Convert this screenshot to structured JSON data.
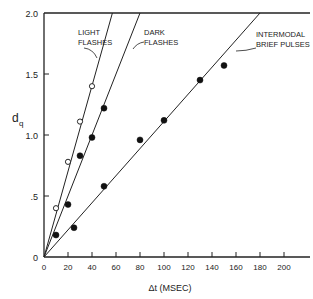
{
  "chart_data": {
    "type": "scatter",
    "title": "",
    "xlabel": "Δt (MSEC)",
    "ylabel": "d_q",
    "ylabel_main": "d",
    "ylabel_sub": "q",
    "xlim": [
      0,
      220
    ],
    "ylim": [
      0,
      2.0
    ],
    "grid": false,
    "legend": "none (inline annotations)",
    "x_ticks": [
      0,
      20,
      40,
      60,
      80,
      100,
      120,
      140,
      160,
      180,
      200
    ],
    "x_tick_labels": [
      "0",
      "20",
      "40",
      "60",
      "80",
      "100",
      "120",
      "140",
      "160",
      "180",
      "200"
    ],
    "y_ticks": [
      0,
      0.5,
      1.0,
      1.5,
      2.0
    ],
    "y_tick_labels": [
      "0",
      ".5",
      "1.0",
      "1.5",
      "2.0"
    ],
    "series": [
      {
        "name": "LIGHT FLASHES",
        "marker": "open-circle",
        "points": [
          [
            10,
            0.4
          ],
          [
            20,
            0.78
          ],
          [
            30,
            1.11
          ],
          [
            40,
            1.4
          ]
        ],
        "fit_line": {
          "from": [
            0,
            0
          ],
          "to": [
            57,
            2.0
          ]
        }
      },
      {
        "name": "DARK FLASHES",
        "marker": "filled-circle",
        "points": [
          [
            10,
            0.18
          ],
          [
            20,
            0.43
          ],
          [
            30,
            0.83
          ],
          [
            40,
            0.98
          ],
          [
            50,
            1.22
          ]
        ],
        "fit_line": {
          "from": [
            0,
            0
          ],
          "to": [
            80,
            2.0
          ]
        }
      },
      {
        "name": "INTERMODAL BRIEF PULSES",
        "marker": "filled-circle",
        "points": [
          [
            25,
            0.24
          ],
          [
            50,
            0.58
          ],
          [
            80,
            0.96
          ],
          [
            100,
            1.12
          ],
          [
            130,
            1.45
          ],
          [
            150,
            1.57
          ]
        ],
        "fit_line": {
          "from": [
            0,
            0
          ],
          "to": [
            180,
            2.0
          ]
        }
      }
    ],
    "annotations": [
      {
        "lines": [
          "LIGHT",
          "FLASHES"
        ],
        "points_to": "LIGHT FLASHES"
      },
      {
        "lines": [
          "DARK",
          "FLASHES"
        ],
        "points_to": "DARK FLASHES"
      },
      {
        "lines": [
          "INTERMODAL",
          "BRIEF PULSES"
        ],
        "points_to": "INTERMODAL BRIEF PULSES"
      }
    ]
  }
}
